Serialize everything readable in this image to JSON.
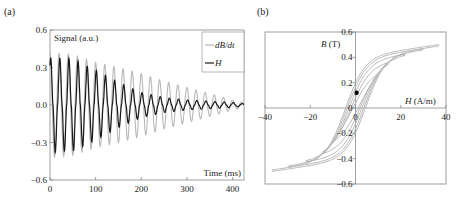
{
  "chart_data": [
    {
      "panel_label": "(a)",
      "type": "line",
      "title": "",
      "xlabel": "Time (ms)",
      "ylabel": "Signal (a.u.)",
      "xlim": [
        0,
        425
      ],
      "ylim": [
        -0.6,
        0.6
      ],
      "xticks": [
        0,
        100,
        200,
        300,
        400
      ],
      "xtick_labels": [
        "0",
        "100",
        "200",
        "300",
        "400"
      ],
      "yticks": [
        0.6,
        0.3,
        0.0,
        -0.3,
        -0.6
      ],
      "ytick_labels": [
        "0.6",
        "0.3",
        "0.0",
        "−0.3",
        "−0.6"
      ],
      "legend": {
        "placement": "top-right",
        "entries": [
          "dB/dt",
          "H"
        ]
      },
      "series": [
        {
          "name": "dB/dt",
          "color": "#b8b8b8",
          "period_ms": 20,
          "envelope": [
            [
              0,
              0.42
            ],
            [
              50,
              0.4
            ],
            [
              100,
              0.34
            ],
            [
              150,
              0.3
            ],
            [
              200,
              0.25
            ],
            [
              250,
              0.19
            ],
            [
              300,
              0.14
            ],
            [
              350,
              0.09
            ],
            [
              400,
              0.04
            ],
            [
              425,
              0.02
            ]
          ]
        },
        {
          "name": "H",
          "color": "#1a1a1a",
          "period_ms": 20,
          "envelope": [
            [
              0,
              0.38
            ],
            [
              50,
              0.37
            ],
            [
              100,
              0.28
            ],
            [
              150,
              0.18
            ],
            [
              200,
              0.1
            ],
            [
              250,
              0.06
            ],
            [
              300,
              0.04
            ],
            [
              350,
              0.03
            ],
            [
              400,
              0.02
            ],
            [
              425,
              0.01
            ]
          ]
        }
      ]
    },
    {
      "panel_label": "(b)",
      "type": "line",
      "title": "",
      "xlabel": "H (A/m)",
      "ylabel": "B (T)",
      "xlim": [
        -40,
        40
      ],
      "ylim": [
        -0.6,
        0.6
      ],
      "xticks": [
        -40,
        -20,
        0,
        20,
        40
      ],
      "xtick_labels": [
        "−40",
        "−20",
        "0",
        "20",
        "40"
      ],
      "yticks": [
        0.6,
        0.4,
        0.2,
        0,
        -0.2,
        -0.4,
        -0.6
      ],
      "ytick_labels": [
        "0.6",
        "0.4",
        "0.2",
        "0",
        "−0.2",
        "−0.4",
        "−0.6"
      ],
      "series": [
        {
          "name": "B-H hysteresis loops",
          "color": "#b0b0b0",
          "loops": [
            {
              "Hmax": 37,
              "coercivity": 4.5,
              "Bsat": 0.49
            },
            {
              "Hmax": 30,
              "coercivity": 3.8,
              "Bsat": 0.46
            },
            {
              "Hmax": 22,
              "coercivity": 3.0,
              "Bsat": 0.42
            },
            {
              "Hmax": 15,
              "coercivity": 2.2,
              "Bsat": 0.37
            },
            {
              "Hmax": 10,
              "coercivity": 1.5,
              "Bsat": 0.3
            }
          ]
        },
        {
          "name": "point",
          "color": "#000000",
          "points": [
            [
              0.5,
              0.12
            ]
          ]
        }
      ]
    }
  ]
}
